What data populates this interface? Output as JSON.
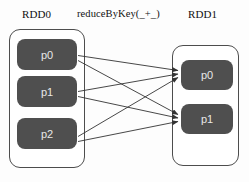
{
  "diagram": {
    "title_labels": {
      "source_rdd": "RDD0",
      "operation": "reduceByKey(_+_)",
      "target_rdd": "RDD1"
    },
    "source_container": {
      "name": "RDD0",
      "partitions": [
        {
          "label": "p0"
        },
        {
          "label": "p1"
        },
        {
          "label": "p2"
        }
      ]
    },
    "target_container": {
      "name": "RDD1",
      "partitions": [
        {
          "label": "p0"
        },
        {
          "label": "p1"
        }
      ]
    },
    "edges": [
      {
        "from": "p0",
        "to": "p0"
      },
      {
        "from": "p0",
        "to": "p1"
      },
      {
        "from": "p1",
        "to": "p0"
      },
      {
        "from": "p1",
        "to": "p1"
      },
      {
        "from": "p2",
        "to": "p0"
      },
      {
        "from": "p2",
        "to": "p1"
      }
    ],
    "colors": {
      "partition_fill": "#4f4f4f",
      "partition_text": "#e8e8e8",
      "container_border": "#4d4d4d",
      "arrow": "#333333",
      "background": "#fdfdfd",
      "label_text": "#111111"
    }
  }
}
